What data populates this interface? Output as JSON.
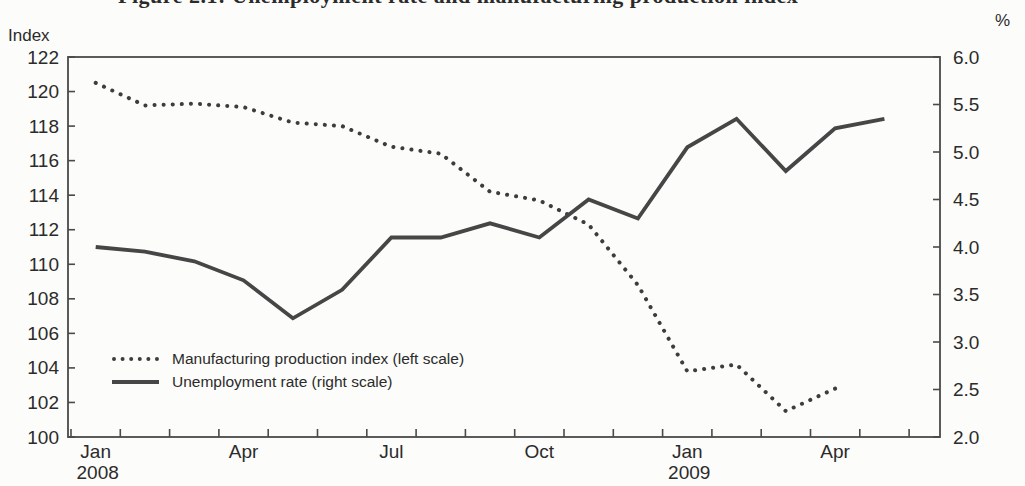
{
  "page": {
    "cropped_title_text": "Figure 2.1: Unemployment rate and manufacturing production index"
  },
  "legend": {
    "production_label": "Manufacturing production index (left scale)",
    "unemployment_label": "Unemployment rate (right scale)"
  },
  "chart_data": {
    "type": "line",
    "title": "Figure 2.1: Unemployment rate and manufacturing production index",
    "months": [
      "Jan 2008",
      "Feb 2008",
      "Mar 2008",
      "Apr 2008",
      "May 2008",
      "Jun 2008",
      "Jul 2008",
      "Aug 2008",
      "Sep 2008",
      "Oct 2008",
      "Nov 2008",
      "Dec 2008",
      "Jan 2009",
      "Feb 2009",
      "Mar 2009",
      "Apr 2009",
      "May 2009"
    ],
    "x_ticks": [
      {
        "month": 0,
        "line1": "Jan",
        "line2": "2008"
      },
      {
        "month": 3,
        "line1": "Apr"
      },
      {
        "month": 6,
        "line1": "Jul"
      },
      {
        "month": 9,
        "line1": "Oct"
      },
      {
        "month": 12,
        "line1": "Jan",
        "line2": "2009"
      },
      {
        "month": 15,
        "line1": "Apr"
      }
    ],
    "left_axis": {
      "label": "Index",
      "min": 100,
      "max": 122,
      "step": 2,
      "tick_labels": [
        "122",
        "120",
        "118",
        "116",
        "114",
        "112",
        "110",
        "108",
        "106",
        "104",
        "102",
        "100"
      ]
    },
    "right_axis": {
      "label": "%",
      "min": 2.0,
      "max": 6.0,
      "step": 0.5,
      "tick_labels": [
        "6.0",
        "5.5",
        "5.0",
        "4.5",
        "4.0",
        "3.5",
        "3.0",
        "2.5",
        "2.0"
      ]
    },
    "series": [
      {
        "name": "Manufacturing production index (left scale)",
        "axis": "left",
        "style": "dotted",
        "color": "#3d3d3d",
        "values": [
          120.5,
          119.2,
          119.3,
          119.1,
          118.2,
          118.0,
          116.8,
          116.4,
          114.2,
          113.7,
          112.3,
          108.8,
          103.8,
          104.2,
          101.5,
          102.8
        ]
      },
      {
        "name": "Unemployment rate (right scale)",
        "axis": "right",
        "style": "solid",
        "color": "#464646",
        "values": [
          4.0,
          3.95,
          3.85,
          3.65,
          3.25,
          3.55,
          4.1,
          4.1,
          4.25,
          4.1,
          4.5,
          4.3,
          5.05,
          5.35,
          4.8,
          5.25,
          5.35
        ]
      }
    ],
    "colors": {
      "frame": "#4a4a4a",
      "text": "#2b2b2b"
    },
    "grid": false,
    "legend_position": "inside lower-left"
  }
}
